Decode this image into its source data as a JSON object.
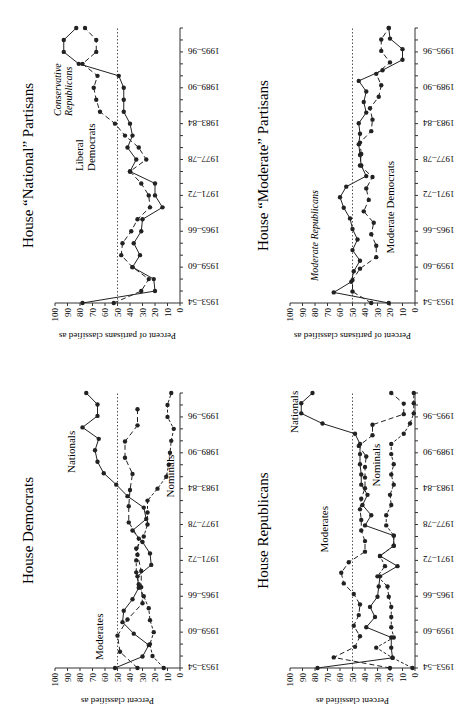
{
  "chart_data": [
    {
      "type": "line",
      "title": "House Democrats",
      "ylabel": "Percent classified as",
      "xlabel": "",
      "ylim": [
        0,
        100
      ],
      "reference_line": 50,
      "categories": [
        "1953–54",
        "1955–56",
        "1957–58",
        "1959–60",
        "1961–62",
        "1963–64",
        "1965–66",
        "1967–68",
        "1969–70",
        "1971–72",
        "1973–74",
        "1975–76",
        "1977–78",
        "1979–80",
        "1981–82",
        "1983–84",
        "1985–86",
        "1987–88",
        "1989–90",
        "1991–92",
        "1993–94",
        "1995–96",
        "1997–98"
      ],
      "tick_labels": [
        "1953–54",
        "1959–60",
        "1965–66",
        "1971–72",
        "1977–78",
        "1983–84",
        "1989–90",
        "1995–96"
      ],
      "series": [
        {
          "name": "Nationals",
          "style": "solid",
          "values": [
            52,
            30,
            25,
            37,
            46,
            45,
            38,
            33,
            23,
            24,
            30,
            38,
            27,
            29,
            42,
            51,
            61,
            66,
            68,
            65,
            78,
            66,
            66,
            75
          ]
        },
        {
          "name": "Moderates",
          "style": "dash",
          "values": [
            34,
            48,
            50,
            42,
            30,
            31,
            34,
            33,
            41,
            41,
            40,
            38,
            44,
            44,
            34,
            34,
            null,
            null,
            null,
            null,
            null,
            null,
            null
          ]
        },
        {
          "name": "Nominals",
          "style": "dot",
          "values": [
            13,
            22,
            24,
            21,
            24,
            25,
            29,
            33,
            35,
            35,
            35,
            29,
            26,
            26,
            26,
            18,
            11,
            9,
            8,
            7,
            5,
            10,
            10,
            7
          ]
        }
      ]
    }
  ],
  "panels": {
    "p1": {
      "title": "House Republicans",
      "ylabel": "Percent classified as",
      "labels": {
        "a": "Nationals",
        "b": "Moderates",
        "c": "Nominals"
      }
    },
    "p2": {
      "title": "House “Moderate” Partisans",
      "ylabel": "Percent of partisans classified as",
      "labels": {
        "a": "Moderate Republicans",
        "b": "Moderate Democrats"
      }
    },
    "p3": {
      "title": "House Democrats",
      "ylabel": "Percent classified as",
      "labels": {
        "a": "Nationals",
        "b": "Moderates",
        "c": "Nominals"
      }
    },
    "p4": {
      "title": "House “National” Partisans",
      "ylabel": "Percent of partisans classified as",
      "labels": {
        "a1": "Conservative",
        "a2": "Republicans",
        "b1": "Liberal",
        "b2": "Democrats"
      }
    }
  },
  "yticks": [
    "0",
    "10",
    "20",
    "30",
    "40",
    "50",
    "60",
    "70",
    "80",
    "90",
    "100"
  ],
  "xticks": [
    "1953–54",
    "1959–60",
    "1965–66",
    "1971–72",
    "1977–78",
    "1983–84",
    "1989–90",
    "1995–96"
  ]
}
